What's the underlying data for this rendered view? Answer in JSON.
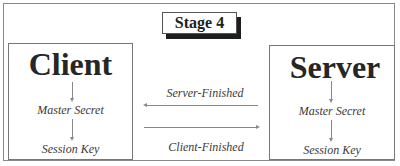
{
  "diagram": {
    "stage_label": "Stage 4",
    "client": {
      "title": "Client",
      "steps": [
        "Master Secret",
        "Session Key"
      ]
    },
    "server": {
      "title": "Server",
      "steps": [
        "Master Secret",
        "Session Key"
      ]
    },
    "messages": [
      {
        "label": "Server-Finished",
        "direction": "server-to-client"
      },
      {
        "label": "Client-Finished",
        "direction": "client-to-server"
      }
    ],
    "colors": {
      "text": "#2a2a2a",
      "lines": "#888888",
      "shadow": "#1e1e1e",
      "background": "#ffffff"
    }
  }
}
